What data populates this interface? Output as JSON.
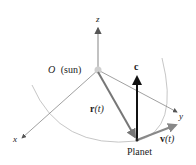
{
  "diagram": {
    "labels": {
      "z_axis": "z",
      "x_axis": "x",
      "y_axis": "y",
      "origin": "O",
      "origin_note": "(sun)",
      "c_vector": "c",
      "r_vector_bold": "r",
      "r_vector_arg": "(t)",
      "v_vector_bold": "v",
      "v_vector_arg": "(t)",
      "planet": "Planet"
    },
    "colors": {
      "axis": "#8a8a8a",
      "orbit": "#b0b0b0",
      "c_vector": "#111111",
      "r_vector": "#777777",
      "v_vector": "#888888",
      "sun": "#cccccc"
    }
  }
}
